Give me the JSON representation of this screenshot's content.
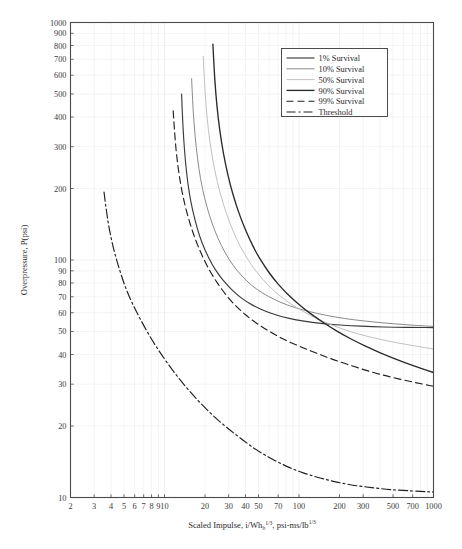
{
  "chart_data": {
    "type": "line",
    "title": "",
    "xlabel": "Scaled Impulse, i/Wh_b^(1/3), psi-ms/lb^(1/3)",
    "xlabel_parts": {
      "lead": "Scaled Impulse, i/Wh",
      "sub": "b",
      "sup": "1/3",
      "tail": ", psi-ms/lb",
      "tail_sup": "1/3"
    },
    "ylabel": "Overpressure, P(psi)",
    "xscale": "log",
    "yscale": "log",
    "xlim": [
      2,
      1000
    ],
    "ylim": [
      10,
      1000
    ],
    "grid": true,
    "grid_color": "#e8e8e8",
    "axis_color": "#4a4a4a",
    "legend_position": "top-right",
    "xticks": [
      2,
      3,
      4,
      5,
      6,
      7,
      8,
      9,
      10,
      20,
      30,
      40,
      50,
      70,
      100,
      200,
      300,
      500,
      700,
      1000
    ],
    "xtick_labels": [
      "2",
      "3",
      "4",
      "5",
      "6",
      "7",
      "8",
      "9",
      "10",
      "20",
      "30",
      "40",
      "50",
      "70",
      "100",
      "200",
      "300",
      "500",
      "700",
      "1000"
    ],
    "yticks": [
      10,
      20,
      30,
      40,
      50,
      60,
      70,
      80,
      90,
      100,
      200,
      300,
      400,
      500,
      600,
      700,
      800,
      900,
      1000
    ],
    "ytick_labels": [
      "10",
      "20",
      "30",
      "40",
      "50",
      "60",
      "70",
      "80",
      "90",
      "100",
      "200",
      "300",
      "400",
      "500",
      "600",
      "700",
      "800",
      "900",
      "1000"
    ],
    "series": [
      {
        "name": "1% Survival",
        "color": "#3a3a3a",
        "width": 1.15,
        "dash": "none",
        "asymptote_x": 13.2,
        "asymptote_y": 52,
        "points": [
          [
            13.4,
            500
          ],
          [
            13.6,
            400
          ],
          [
            13.9,
            320
          ],
          [
            14.3,
            260
          ],
          [
            14.9,
            210
          ],
          [
            15.7,
            175
          ],
          [
            16.8,
            148
          ],
          [
            18.2,
            126
          ],
          [
            20.0,
            110
          ],
          [
            22.5,
            96
          ],
          [
            25.5,
            86
          ],
          [
            29.5,
            78
          ],
          [
            34.5,
            71.5
          ],
          [
            41.0,
            66.5
          ],
          [
            49.0,
            63.0
          ],
          [
            60.0,
            60.0
          ],
          [
            75.0,
            57.6
          ],
          [
            95.0,
            56.0
          ],
          [
            125.0,
            54.6
          ],
          [
            170.0,
            53.6
          ],
          [
            240.0,
            52.9
          ],
          [
            350.0,
            52.4
          ],
          [
            520.0,
            52.1
          ],
          [
            750.0,
            52.0
          ],
          [
            1000.0,
            51.9
          ]
        ]
      },
      {
        "name": "10% Survival",
        "color": "#8a8a8a",
        "width": 1.0,
        "dash": "none",
        "asymptote_x": 15.5,
        "asymptote_y": 46,
        "points": [
          [
            15.9,
            580
          ],
          [
            16.2,
            460
          ],
          [
            16.6,
            370
          ],
          [
            17.2,
            298
          ],
          [
            18.0,
            242
          ],
          [
            19.1,
            200
          ],
          [
            20.6,
            168
          ],
          [
            22.5,
            143
          ],
          [
            25.0,
            123
          ],
          [
            28.2,
            107
          ],
          [
            32.3,
            95
          ],
          [
            37.5,
            85.5
          ],
          [
            44.5,
            78.0
          ],
          [
            53.5,
            72.5
          ],
          [
            66.0,
            68.0
          ],
          [
            82.0,
            64.5
          ],
          [
            105.0,
            61.8
          ],
          [
            137.0,
            59.5
          ],
          [
            185.0,
            57.5
          ],
          [
            255.0,
            56.0
          ],
          [
            360.0,
            54.8
          ],
          [
            520.0,
            53.8
          ],
          [
            750.0,
            53.0
          ],
          [
            1000.0,
            52.5
          ]
        ]
      },
      {
        "name": "50% Survival",
        "color": "#c0c0c0",
        "width": 1.0,
        "dash": "none",
        "asymptote_x": 19.0,
        "asymptote_y": 39,
        "points": [
          [
            19.4,
            720
          ],
          [
            19.8,
            560
          ],
          [
            20.4,
            440
          ],
          [
            21.2,
            350
          ],
          [
            22.4,
            280
          ],
          [
            24.0,
            228
          ],
          [
            26.1,
            188
          ],
          [
            28.8,
            157
          ],
          [
            32.2,
            133
          ],
          [
            36.5,
            114
          ],
          [
            42.0,
            99.5
          ],
          [
            49.0,
            88.0
          ],
          [
            58.0,
            79.0
          ],
          [
            70.0,
            71.5
          ],
          [
            86.0,
            65.5
          ],
          [
            108.0,
            60.5
          ],
          [
            137.0,
            56.5
          ],
          [
            178.0,
            53.0
          ],
          [
            238.0,
            50.0
          ],
          [
            325.0,
            47.6
          ],
          [
            455.0,
            45.6
          ],
          [
            640.0,
            44.0
          ],
          [
            880.0,
            42.7
          ],
          [
            1000.0,
            42.2
          ]
        ]
      },
      {
        "name": "90% Survival",
        "color": "#2a2a2a",
        "width": 1.35,
        "dash": "none",
        "asymptote_x": 22.5,
        "asymptote_y": 32,
        "points": [
          [
            22.9,
            810
          ],
          [
            23.4,
            630
          ],
          [
            24.1,
            495
          ],
          [
            25.1,
            392
          ],
          [
            26.5,
            313
          ],
          [
            28.4,
            253
          ],
          [
            30.8,
            207
          ],
          [
            33.9,
            172
          ],
          [
            37.7,
            145
          ],
          [
            42.4,
            124
          ],
          [
            48.2,
            107
          ],
          [
            55.5,
            94.0
          ],
          [
            64.5,
            83.5
          ],
          [
            76.0,
            75.0
          ],
          [
            91.0,
            68.0
          ],
          [
            110.0,
            62.0
          ],
          [
            135.0,
            57.0
          ],
          [
            168.0,
            52.5
          ],
          [
            212.0,
            48.5
          ],
          [
            272.0,
            45.0
          ],
          [
            352.0,
            42.0
          ],
          [
            460.0,
            39.4
          ],
          [
            610.0,
            37.0
          ],
          [
            800.0,
            35.0
          ],
          [
            1000.0,
            33.6
          ]
        ]
      },
      {
        "name": "99% Survival",
        "color": "#1f1f1f",
        "width": 1.15,
        "dash": "7,4",
        "asymptote_x": 11.3,
        "asymptote_y": 29,
        "points": [
          [
            11.6,
            425
          ],
          [
            11.9,
            340
          ],
          [
            12.3,
            275
          ],
          [
            12.9,
            224
          ],
          [
            13.7,
            185
          ],
          [
            14.8,
            155
          ],
          [
            16.2,
            131
          ],
          [
            18.0,
            112
          ],
          [
            20.2,
            97.0
          ],
          [
            23.0,
            85.0
          ],
          [
            26.5,
            75.5
          ],
          [
            31.0,
            67.5
          ],
          [
            36.5,
            61.5
          ],
          [
            43.5,
            56.5
          ],
          [
            52.5,
            52.5
          ],
          [
            64.0,
            49.0
          ],
          [
            79.0,
            46.0
          ],
          [
            99.0,
            43.5
          ],
          [
            125.0,
            41.2
          ],
          [
            160.0,
            39.0
          ],
          [
            208.0,
            37.0
          ],
          [
            272.0,
            35.2
          ],
          [
            358.0,
            33.6
          ],
          [
            475.0,
            32.2
          ],
          [
            635.0,
            31.0
          ],
          [
            840.0,
            30.0
          ],
          [
            1000.0,
            29.4
          ]
        ]
      },
      {
        "name": "Threshold",
        "color": "#1f1f1f",
        "width": 1.15,
        "dash": "9,3,2,3",
        "asymptote_x": 3.4,
        "asymptote_y": 11,
        "points": [
          [
            3.55,
            193
          ],
          [
            3.7,
            160
          ],
          [
            3.9,
            133
          ],
          [
            4.2,
            110
          ],
          [
            4.6,
            92
          ],
          [
            5.1,
            77
          ],
          [
            5.8,
            65
          ],
          [
            6.7,
            55.5
          ],
          [
            7.8,
            47.5
          ],
          [
            9.2,
            41.0
          ],
          [
            11.0,
            35.5
          ],
          [
            13.2,
            31.0
          ],
          [
            16.0,
            27.3
          ],
          [
            19.5,
            24.2
          ],
          [
            24.0,
            21.6
          ],
          [
            30.0,
            19.4
          ],
          [
            37.5,
            17.6
          ],
          [
            47.0,
            16.0
          ],
          [
            59.0,
            14.8
          ],
          [
            75.0,
            13.8
          ],
          [
            95.0,
            13.0
          ],
          [
            122.0,
            12.4
          ],
          [
            158.0,
            11.9
          ],
          [
            205.0,
            11.5
          ],
          [
            268.0,
            11.2
          ],
          [
            352.0,
            11.0
          ],
          [
            465.0,
            10.8
          ],
          [
            615.0,
            10.7
          ],
          [
            810.0,
            10.6
          ],
          [
            1000.0,
            10.55
          ]
        ]
      }
    ],
    "legend_entries": [
      {
        "label": "1% Survival",
        "color": "#3a3a3a",
        "width": 1.15,
        "dash": "none"
      },
      {
        "label": "10% Survival",
        "color": "#8a8a8a",
        "width": 1.0,
        "dash": "none"
      },
      {
        "label": "50% Survival",
        "color": "#c0c0c0",
        "width": 1.0,
        "dash": "none"
      },
      {
        "label": "90% Survival",
        "color": "#2a2a2a",
        "width": 1.35,
        "dash": "none"
      },
      {
        "label": "99% Survival",
        "color": "#1f1f1f",
        "width": 1.15,
        "dash": "7,4"
      },
      {
        "label": "Threshold",
        "color": "#1f1f1f",
        "width": 1.15,
        "dash": "9,3,2,3"
      }
    ]
  }
}
